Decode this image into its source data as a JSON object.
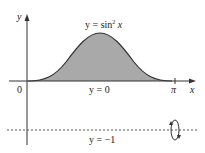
{
  "figure": {
    "y_axis_label": "y",
    "x_axis_label": "x",
    "origin_label": "0",
    "pi_label": "π",
    "curve_label": {
      "prefix": "y = sin",
      "exp": "2",
      "suffix": " x"
    },
    "baseline_label": "y = 0",
    "axis_of_rotation_label": "y = −1",
    "region_fill": "#a9a9a9",
    "curve_color": "#333333"
  }
}
